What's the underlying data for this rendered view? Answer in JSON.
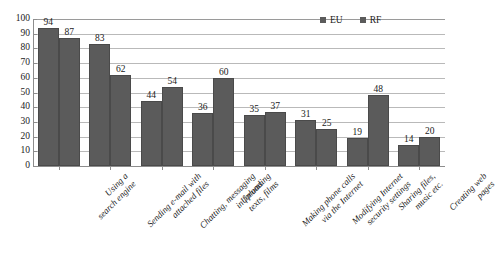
{
  "chart_data": {
    "type": "bar",
    "title": "",
    "subtitle": "",
    "xlabel": "",
    "ylabel": "",
    "ylim": [
      0,
      100
    ],
    "ytick_step": 10,
    "yticks": [
      "100",
      "90",
      "80",
      "70",
      "60",
      "50",
      "40",
      "30",
      "20",
      "10",
      "0"
    ],
    "grid": true,
    "legend_position": "top-right",
    "categories": [
      "Using a search engine",
      "Sending e-mail with attached files",
      "Chatting, messaging in forums",
      "Uploading texts, films",
      "Making phone calls via the Internet",
      "Modifying Internet security settings",
      "Sharing files, music etc.",
      "Creating web pages"
    ],
    "category_lines": [
      [
        "Using a",
        "search engine"
      ],
      [
        "Sending e-mail with",
        "attached files"
      ],
      [
        "Chatting, messaging",
        "in forums"
      ],
      [
        "Uploading",
        "texts, films"
      ],
      [
        "Making phone calls",
        "via the Internet"
      ],
      [
        "Modifying Internet",
        "security settings"
      ],
      [
        "Sharing files,",
        "music etc."
      ],
      [
        "Creating web",
        "pages"
      ]
    ],
    "series": [
      {
        "name": "EU",
        "color": "#5b5b5b",
        "values": [
          94,
          83,
          44,
          36,
          35,
          31,
          19,
          14
        ]
      },
      {
        "name": "RF",
        "color": "#5b5b5b",
        "values": [
          87,
          62,
          54,
          60,
          37,
          25,
          48,
          20
        ]
      }
    ]
  },
  "legend": {
    "items": [
      {
        "label": "EU"
      },
      {
        "label": "RF"
      }
    ]
  }
}
